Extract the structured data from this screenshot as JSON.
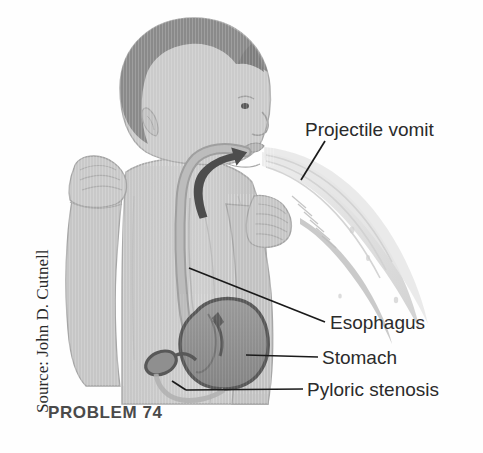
{
  "figure": {
    "caption": "PROBLEM 74",
    "source_credit": "Source: John D. Cutnell"
  },
  "labels": {
    "projectile_vomit": "Projectile vomit",
    "esophagus": "Esophagus",
    "stomach": "Stomach",
    "pyloric_stenosis": "Pyloric stenosis"
  },
  "colors": {
    "background": "#fefefe",
    "skin": "#c9c9c9",
    "skin_shadow": "#b4b4b4",
    "hair_dark": "#8c8c8c",
    "outline": "#8e8e8e",
    "organ_fill": "#8f8f8f",
    "organ_outline": "#5e5e5e",
    "esophagus_fill": "#b0b0b0",
    "vomit_spray": "#d8d8d8",
    "vomit_blob": "#c2c2c2",
    "leader_line": "#1a1a1a",
    "label_text": "#2b2b2b",
    "caption_text": "#4a4a4a"
  }
}
